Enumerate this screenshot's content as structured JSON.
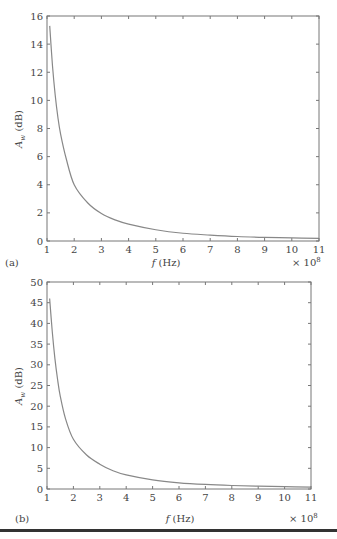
{
  "chart_data": [
    {
      "type": "line",
      "panel_label": "(a)",
      "title": "",
      "xlabel": "f (Hz)",
      "ylabel": "A_w (dB)",
      "x_multiplier": "× 10^8",
      "xlim": [
        1,
        11
      ],
      "ylim": [
        0,
        16
      ],
      "xticks": [
        1,
        2,
        3,
        4,
        5,
        6,
        7,
        8,
        9,
        10,
        11
      ],
      "yticks": [
        0,
        2,
        4,
        6,
        8,
        10,
        12,
        14,
        16
      ],
      "grid": false,
      "series": [
        {
          "name": "A_w",
          "x": [
            1.1,
            1.2,
            1.3,
            1.4,
            1.5,
            1.7,
            2,
            2.5,
            3,
            3.5,
            4,
            5,
            6,
            7,
            8,
            9,
            10,
            11
          ],
          "y": [
            15.3,
            12.5,
            10.4,
            8.8,
            7.6,
            5.9,
            4.0,
            2.7,
            1.95,
            1.5,
            1.2,
            0.8,
            0.55,
            0.42,
            0.32,
            0.26,
            0.22,
            0.19
          ]
        }
      ],
      "frame": {
        "left": 47,
        "right": 319,
        "top": 16,
        "bottom": 241
      }
    },
    {
      "type": "line",
      "panel_label": "(b)",
      "title": "",
      "xlabel": "f (Hz)",
      "ylabel": "A_w (dB)",
      "x_multiplier": "× 10^8",
      "xlim": [
        1,
        11
      ],
      "ylim": [
        0,
        50
      ],
      "xticks": [
        1,
        2,
        3,
        4,
        5,
        6,
        7,
        8,
        9,
        10,
        11
      ],
      "yticks": [
        0,
        5,
        10,
        15,
        20,
        25,
        30,
        35,
        40,
        45,
        50
      ],
      "grid": false,
      "series": [
        {
          "name": "A_w",
          "x": [
            1.1,
            1.2,
            1.3,
            1.4,
            1.5,
            1.7,
            2,
            2.5,
            3,
            3.5,
            4,
            5,
            6,
            7,
            8,
            9,
            10,
            11
          ],
          "y": [
            46,
            38,
            31.5,
            26.5,
            22.5,
            17,
            12,
            8.2,
            6.0,
            4.4,
            3.4,
            2.2,
            1.5,
            1.1,
            0.85,
            0.68,
            0.56,
            0.47
          ]
        }
      ],
      "frame": {
        "left": 47,
        "right": 311,
        "top": 282,
        "bottom": 489
      }
    }
  ],
  "labels": {
    "a": {
      "panel": "(a)",
      "xlabel_f": "f",
      "xlabel_unit": " (Hz)",
      "ylabel_main": "A",
      "ylabel_sub": "w",
      "ylabel_unit": " (dB)",
      "mult_base": "× 10",
      "mult_exp": "8"
    },
    "b": {
      "panel": "(b)",
      "xlabel_f": "f",
      "xlabel_unit": " (Hz)",
      "ylabel_main": "A",
      "ylabel_sub": "w",
      "ylabel_unit": " (dB)",
      "mult_base": "× 10",
      "mult_exp": "8"
    }
  }
}
